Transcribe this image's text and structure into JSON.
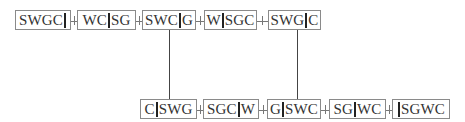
{
  "diagram": {
    "top_row": [
      {
        "left": "SWGC",
        "right": ""
      },
      {
        "left": "WC",
        "right": "SG"
      },
      {
        "left": "SWC",
        "right": "G"
      },
      {
        "left": "W",
        "right": "SGC"
      },
      {
        "left": "SWG",
        "right": "C"
      }
    ],
    "bottom_row": [
      {
        "left": "C",
        "right": "SWG"
      },
      {
        "left": "SGC",
        "right": "W"
      },
      {
        "left": "G",
        "right": "SWC"
      },
      {
        "left": "SG",
        "right": "WC"
      },
      {
        "left": "",
        "right": "SGWC"
      }
    ],
    "connections": [
      {
        "from": "SWC|G",
        "to": "C|SWG"
      },
      {
        "from": "SWG|C",
        "to": "G|SWC"
      }
    ]
  }
}
